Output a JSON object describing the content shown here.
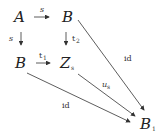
{
  "diagram": {
    "nodes": {
      "A": {
        "label": "A"
      },
      "B_top": {
        "label": "B"
      },
      "B_left": {
        "label": "B"
      },
      "Z": {
        "label": "Z",
        "subscript": "s"
      },
      "B1": {
        "label": "B",
        "subscript": "1"
      }
    },
    "arrows": {
      "A_to_Btop": {
        "label": "s",
        "symbol": "→"
      },
      "A_to_Bleft": {
        "label": "s",
        "symbol": "↓"
      },
      "Btop_to_Z": {
        "label": "t",
        "subscript": "2",
        "symbol": "↓"
      },
      "Bleft_to_Z": {
        "label": "t",
        "subscript": "1",
        "symbol": "→"
      },
      "Btop_to_B1": {
        "label": "id"
      },
      "Z_to_B1": {
        "label": "u",
        "subscript": "s"
      },
      "Bleft_to_B1": {
        "label": "id"
      }
    }
  }
}
